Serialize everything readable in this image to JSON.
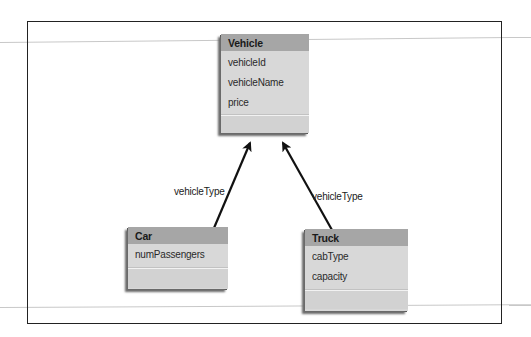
{
  "diagram": {
    "type": "class-diagram",
    "entities": [
      {
        "name": "Vehicle",
        "attributes": [
          "vehicleId",
          "vehicleName",
          "price"
        ]
      },
      {
        "name": "Car",
        "attributes": [
          "numPassengers"
        ]
      },
      {
        "name": "Truck",
        "attributes": [
          "cabType",
          "capacity"
        ]
      }
    ],
    "relationships": [
      {
        "from": "Car",
        "to": "Vehicle",
        "label": "vehicleType"
      },
      {
        "from": "Truck",
        "to": "Vehicle",
        "label": "vehicleType"
      }
    ]
  },
  "colors": {
    "header": "#a6a6a6",
    "body": "#d8d8d8",
    "line": "#111111"
  }
}
